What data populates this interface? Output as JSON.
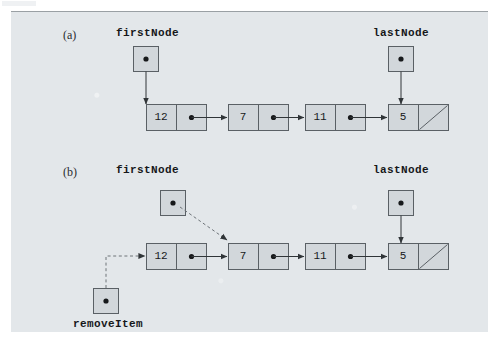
{
  "figure": {
    "background_color": "#e3e7ea",
    "box_fill": "#d2d7db",
    "stroke_color": "#4a4f54",
    "dashed_color": "#7b8186"
  },
  "panels": [
    {
      "id": "a",
      "letter": "(a)",
      "first_node_label": "firstNode",
      "last_node_label": "lastNode",
      "remove_item_label": null,
      "nodes": [
        {
          "value": "12",
          "link": "dot"
        },
        {
          "value": "7",
          "link": "dot"
        },
        {
          "value": "11",
          "link": "dot"
        },
        {
          "value": "5",
          "link": "null"
        }
      ]
    },
    {
      "id": "b",
      "letter": "(b)",
      "first_node_label": "firstNode",
      "last_node_label": "lastNode",
      "remove_item_label": "removeItem",
      "nodes": [
        {
          "value": "12",
          "link": "dot"
        },
        {
          "value": "7",
          "link": "dot"
        },
        {
          "value": "11",
          "link": "dot"
        },
        {
          "value": "5",
          "link": "null"
        }
      ]
    }
  ],
  "legend": {
    "dot_meaning": "pointer (non-null reference)",
    "diagonal_meaning": "null reference",
    "solid_arrow_meaning": "current reference",
    "dashed_arrow_meaning": "new / reassigned reference"
  }
}
